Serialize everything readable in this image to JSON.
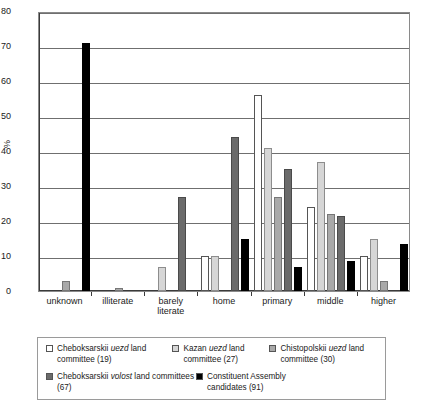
{
  "chart_data": {
    "type": "bar",
    "title": "",
    "xlabel": "",
    "ylabel": "%",
    "ylim": [
      0,
      80
    ],
    "yticks": [
      0,
      10,
      20,
      30,
      40,
      50,
      60,
      70,
      80
    ],
    "grid": true,
    "legend_position": "bottom",
    "categories": [
      "unknown",
      "illiterate",
      "barely literate",
      "home",
      "primary",
      "middle",
      "higher"
    ],
    "series": [
      {
        "name": "Cheboksarskii uezd land committee (19)",
        "color": "#ffffff",
        "values": [
          0,
          0,
          0,
          10,
          56,
          24,
          10
        ]
      },
      {
        "name": "Kazan uezd land committee (27)",
        "color": "#d6d6d6",
        "values": [
          0,
          0,
          7,
          10,
          41,
          37,
          15
        ]
      },
      {
        "name": "Chistopolskii uezd land committee (30)",
        "color": "#a9a9a9",
        "values": [
          3,
          1,
          0,
          0,
          27,
          22,
          3
        ]
      },
      {
        "name": "Cheboksarskii volost land committees (67)",
        "color": "#6b6b6b",
        "values": [
          0,
          0,
          27,
          44,
          35,
          21.5,
          0
        ]
      },
      {
        "name": "Constituent Assembly candidates (91)",
        "color": "#000000",
        "values": [
          71,
          0,
          0,
          15,
          7,
          8.5,
          13.5
        ]
      }
    ]
  },
  "legend": {
    "items": [
      {
        "swatch": "#ffffff",
        "pre": "Cheboksarskii ",
        "em": "uezd",
        "post": " land committee (19)"
      },
      {
        "swatch": "#d6d6d6",
        "pre": "Kazan ",
        "em": "uezd",
        "post": " land committee (27)"
      },
      {
        "swatch": "#a9a9a9",
        "pre": "Chistopolskii ",
        "em": "uezd",
        "post": " land committee (30)"
      },
      {
        "swatch": "#6b6b6b",
        "pre": "Cheboksarskii ",
        "em": "volost",
        "post": " land committees (67)"
      },
      {
        "swatch": "#000000",
        "pre": "Constituent Assembly candidates (91)",
        "em": "",
        "post": ""
      }
    ]
  }
}
